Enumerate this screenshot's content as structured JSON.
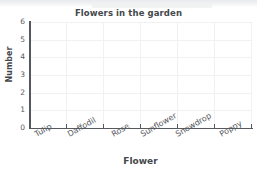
{
  "chart_data": {
    "type": "bar",
    "title": "Flowers in the garden",
    "xlabel": "Flower",
    "ylabel": "Number",
    "categories": [
      "Tulip",
      "Daffodil",
      "Rose",
      "Sunflower",
      "Snowdrop",
      "Poppy"
    ],
    "values": [
      0,
      0,
      0,
      0,
      0,
      0
    ],
    "ytick_labels": [
      "6",
      "5",
      "4",
      "3",
      "2",
      "1",
      "0"
    ],
    "yticks": [
      6,
      5,
      4,
      3,
      2,
      1,
      0
    ],
    "ylim": [
      0,
      6
    ],
    "grid": true,
    "legend": "none",
    "colors": {
      "axis": "#55585d",
      "text": "#44474b",
      "grid": "#f1f1f3",
      "background": "#ffffff"
    }
  }
}
